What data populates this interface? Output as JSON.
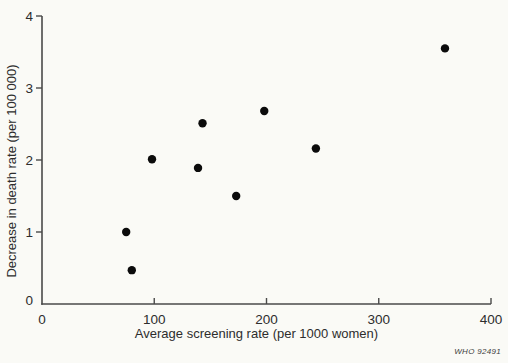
{
  "figure": {
    "watermark": "WHO 92491"
  },
  "chart_data": {
    "type": "scatter",
    "title": "",
    "xlabel": "Average screening rate (per 1000 women)",
    "ylabel": "Decrease in death rate (per 100 000)",
    "xlim": [
      0,
      400
    ],
    "ylim": [
      0,
      4
    ],
    "x_ticks": [
      0,
      100,
      200,
      300,
      400
    ],
    "y_ticks": [
      0,
      1,
      2,
      3,
      4
    ],
    "grid": false,
    "legend": false,
    "points": [
      {
        "x": 75,
        "y": 1.0
      },
      {
        "x": 80,
        "y": 0.47
      },
      {
        "x": 98,
        "y": 2.01
      },
      {
        "x": 139,
        "y": 1.89
      },
      {
        "x": 143,
        "y": 2.51
      },
      {
        "x": 173,
        "y": 1.5
      },
      {
        "x": 198,
        "y": 2.68
      },
      {
        "x": 244,
        "y": 2.16
      },
      {
        "x": 359,
        "y": 3.55
      }
    ],
    "marker": {
      "shape": "circle",
      "radius_px": 4.2,
      "color": "#0b0b0b"
    },
    "colors": {
      "axis": "#4a4a4a",
      "text": "#2d2d2d",
      "background": "#fafaf6"
    }
  }
}
